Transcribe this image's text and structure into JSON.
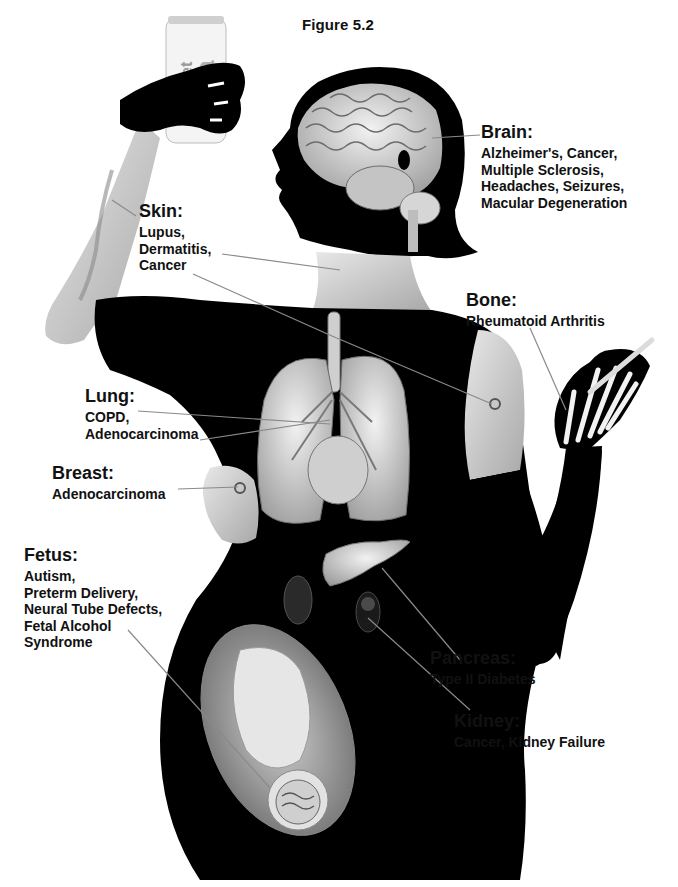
{
  "figure": {
    "title": "Figure 5.2",
    "can_text": "Diet",
    "colors": {
      "silhouette": "#000000",
      "skin": "#d9d9d9",
      "organ": "#cfcfcf",
      "leader_line": "#8a8a8a",
      "background": "#ffffff"
    }
  },
  "labels": {
    "brain": {
      "heading": "Brain:",
      "items": [
        "Alzheimer's, Cancer,",
        "Multiple Sclerosis,",
        "Headaches, Seizures,",
        "Macular Degeneration"
      ]
    },
    "skin": {
      "heading": "Skin:",
      "items": [
        "Lupus,",
        "Dermatitis,",
        "Cancer"
      ]
    },
    "bone": {
      "heading": "Bone:",
      "items": [
        "Rheumatoid Arthritis"
      ]
    },
    "lung": {
      "heading": "Lung:",
      "items": [
        "COPD,",
        "Adenocarcinoma"
      ]
    },
    "breast": {
      "heading": "Breast:",
      "items": [
        "Adenocarcinoma"
      ]
    },
    "fetus": {
      "heading": "Fetus:",
      "items": [
        "Autism,",
        "Preterm Delivery,",
        "Neural Tube Defects,",
        "Fetal Alcohol",
        "Syndrome"
      ]
    },
    "pancreas": {
      "heading": "Pancreas:",
      "items": [
        "Type II Diabetes"
      ]
    },
    "kidney": {
      "heading": "Kidney:",
      "items": [
        "Cancer, Kidney Failure"
      ]
    }
  }
}
